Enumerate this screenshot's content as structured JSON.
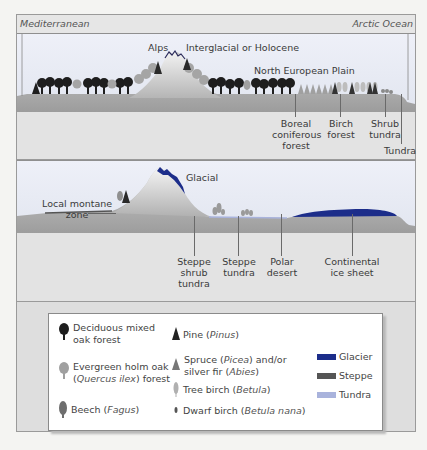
{
  "header": {
    "left_label": "Mediterranean",
    "right_label": "Arctic Ocean"
  },
  "panel_interglacial": {
    "title": "Interglacial or Holocene",
    "mountain_label": "Alps",
    "plain_label": "North European Plain",
    "zones": [
      {
        "label_lines": [
          "Boreal",
          "coniferous",
          "forest"
        ]
      },
      {
        "label_lines": [
          "Birch",
          "forest"
        ]
      },
      {
        "label_lines": [
          "Shrub",
          "tundra"
        ]
      },
      {
        "label_lines": [
          "Tundra"
        ]
      }
    ]
  },
  "panel_glacial": {
    "title": "Glacial",
    "montane_label_lines": [
      "Local montane",
      "zone"
    ],
    "zones": [
      {
        "label_lines": [
          "Steppe",
          "shrub",
          "tundra"
        ]
      },
      {
        "label_lines": [
          "Steppe",
          "tundra"
        ]
      },
      {
        "label_lines": [
          "Polar",
          "desert"
        ]
      },
      {
        "label_lines": [
          "Continental",
          "ice sheet"
        ]
      }
    ]
  },
  "legend": {
    "trees": [
      {
        "icon": "deciduous-oak-icon",
        "text_lines": [
          "Deciduous mixed",
          "oak forest"
        ]
      },
      {
        "icon": "holm-oak-icon",
        "text_lines": [
          "Evergreen holm oak",
          "(Quercus ilex) forest"
        ]
      },
      {
        "icon": "beech-icon",
        "name": "Beech",
        "latin": "Fagus"
      },
      {
        "icon": "pine-icon",
        "name": "Pine",
        "latin": "Pinus"
      },
      {
        "icon": "spruce-icon",
        "line1_name": "Spruce",
        "line1_latin": "Picea",
        "line1_suffix": "and/or",
        "line2_name": "silver fir",
        "line2_latin": "Abies"
      },
      {
        "icon": "tree-birch-icon",
        "name": "Tree birch",
        "latin": "Betula"
      },
      {
        "icon": "dwarf-birch-icon",
        "name": "Dwarf birch",
        "latin": "Betula nana"
      }
    ],
    "surfaces": [
      {
        "label": "Glacier",
        "color": "#1c2d8a"
      },
      {
        "label": "Steppe",
        "color": "#555555"
      },
      {
        "label": "Tundra",
        "color": "#a9b3dc"
      }
    ]
  },
  "colors": {
    "oak": "#1e1e1e",
    "holm_oak": "#9a9a9a",
    "beech": "#6e6e6e",
    "glacier": "#1c2d8a",
    "ground": "#b9b9b9"
  }
}
